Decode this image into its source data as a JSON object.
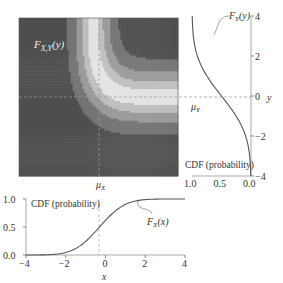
{
  "chart_data": [
    {
      "type": "heatmap",
      "title": "Joint CDF contour",
      "annotation": "F_{X,Y}(y)",
      "x_range": [
        -4,
        4
      ],
      "y_range": [
        -4,
        4
      ],
      "mu_x": -0.3,
      "mu_y": 0.0,
      "mu_x_label": "μ_X",
      "mu_y_label": "μ_Y",
      "levels": [
        0,
        0.1,
        0.2,
        0.3,
        0.4,
        0.5,
        0.6,
        0.7,
        0.8,
        0.9,
        1.0
      ],
      "colormap": "diverging grayscale (dark at 0 and 1, light at 0.5)"
    },
    {
      "type": "line",
      "title": "Marginal CDF of Y",
      "annotation": "F_Y(y)",
      "ylabel": "y",
      "xlabel": "CDF (probability)",
      "y_ticks": [
        -4,
        -2,
        0,
        2,
        4
      ],
      "x_ticks": [
        1.0,
        0.5,
        0.0
      ],
      "x_inverted": true,
      "ylim": [
        -4,
        4
      ],
      "xlim": [
        0,
        1
      ],
      "mu": 0.0,
      "sigma": 1.5
    },
    {
      "type": "line",
      "title": "Marginal CDF of X",
      "annotation": "F_X(x)",
      "xlabel": "x",
      "ylabel": "CDF (probability)",
      "x_ticks": [
        -4,
        -2,
        0,
        2,
        4
      ],
      "y_ticks": [
        0.0,
        0.5,
        1.0
      ],
      "xlim": [
        -4,
        4
      ],
      "ylim": [
        0,
        1
      ],
      "mu": -0.3,
      "sigma": 1.0
    }
  ],
  "labels": {
    "joint": "F",
    "joint_sub": "X,Y",
    "joint_arg": "(y)",
    "fy": "F",
    "fy_sub": "Y",
    "fy_arg": "(y)",
    "fx": "F",
    "fx_sub": "X",
    "fx_arg": "(x)",
    "mu": "μ",
    "mux_sub": "X",
    "muy_sub": "Y",
    "cdf_right": "CDF (probability)",
    "cdf_bottom": "CDF (probability)",
    "x_axis": "x",
    "y_axis": "y"
  }
}
